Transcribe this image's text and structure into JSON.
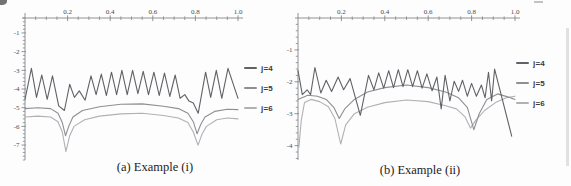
{
  "figure": {
    "background": "#fdfdfd",
    "axis_color": "#85868a",
    "tick_label_color": "#4a4a4e"
  },
  "chart_data": [
    {
      "type": "line",
      "title": "(a) Example (i)",
      "xlabel": "",
      "ylabel": "",
      "xlim": [
        0,
        1.0
      ],
      "ylim": [
        -7.8,
        -0.2
      ],
      "grid": false,
      "legend_position": "right",
      "x_ticks_major": [
        0.2,
        0.4,
        0.6,
        0.8,
        1.0
      ],
      "x_tick_labels": [
        "0.2",
        "0.4",
        "0.6",
        "0.8",
        "1.0"
      ],
      "x_minor_step": 0.05,
      "y_ticks_major": [
        -1,
        -2,
        -3,
        -4,
        -5,
        -6,
        -7
      ],
      "y_tick_labels": [
        "-1",
        "-2",
        "-3",
        "-4",
        "-5",
        "-6",
        "-7"
      ],
      "y_minor_step": 0.2,
      "series": [
        {
          "name": "j=4",
          "color": "#616267",
          "points": [
            [
              0,
              -4.55
            ],
            [
              0.03,
              -2.9
            ],
            [
              0.054,
              -4.45
            ],
            [
              0.079,
              -3.25
            ],
            [
              0.104,
              -4.55
            ],
            [
              0.129,
              -3.3
            ],
            [
              0.158,
              -4.9
            ],
            [
              0.185,
              -5.15
            ],
            [
              0.21,
              -3.75
            ],
            [
              0.232,
              -4.45
            ],
            [
              0.255,
              -4.1
            ],
            [
              0.282,
              -4.6
            ],
            [
              0.31,
              -3.3
            ],
            [
              0.334,
              -4.3
            ],
            [
              0.358,
              -3.2
            ],
            [
              0.382,
              -4.35
            ],
            [
              0.406,
              -3.1
            ],
            [
              0.43,
              -4.3
            ],
            [
              0.455,
              -3.0
            ],
            [
              0.48,
              -4.3
            ],
            [
              0.505,
              -3.0
            ],
            [
              0.53,
              -4.25
            ],
            [
              0.555,
              -3.05
            ],
            [
              0.58,
              -4.3
            ],
            [
              0.605,
              -3.1
            ],
            [
              0.63,
              -4.35
            ],
            [
              0.655,
              -3.15
            ],
            [
              0.68,
              -4.4
            ],
            [
              0.705,
              -3.25
            ],
            [
              0.728,
              -4.5
            ],
            [
              0.75,
              -4.3
            ],
            [
              0.77,
              -4.65
            ],
            [
              0.79,
              -4.75
            ],
            [
              0.813,
              -5.3
            ],
            [
              0.848,
              -3.1
            ],
            [
              0.872,
              -4.45
            ],
            [
              0.898,
              -3.0
            ],
            [
              0.924,
              -4.5
            ],
            [
              0.953,
              -2.9
            ],
            [
              1.0,
              -4.5
            ]
          ]
        },
        {
          "name": "j=5",
          "color": "#8e8f93",
          "points": [
            [
              0,
              -5.05
            ],
            [
              0.06,
              -5.0
            ],
            [
              0.12,
              -5.05
            ],
            [
              0.155,
              -5.3
            ],
            [
              0.175,
              -5.8
            ],
            [
              0.19,
              -6.5
            ],
            [
              0.205,
              -6.0
            ],
            [
              0.225,
              -5.5
            ],
            [
              0.27,
              -5.15
            ],
            [
              0.35,
              -4.95
            ],
            [
              0.45,
              -4.82
            ],
            [
              0.55,
              -4.8
            ],
            [
              0.65,
              -4.92
            ],
            [
              0.72,
              -5.05
            ],
            [
              0.765,
              -5.3
            ],
            [
              0.79,
              -5.75
            ],
            [
              0.808,
              -6.4
            ],
            [
              0.825,
              -5.9
            ],
            [
              0.845,
              -5.5
            ],
            [
              0.89,
              -5.2
            ],
            [
              0.95,
              -5.08
            ],
            [
              1.0,
              -5.1
            ]
          ]
        },
        {
          "name": "j=6",
          "color": "#b0b1b4",
          "points": [
            [
              0,
              -5.5
            ],
            [
              0.06,
              -5.45
            ],
            [
              0.12,
              -5.5
            ],
            [
              0.155,
              -5.75
            ],
            [
              0.175,
              -6.3
            ],
            [
              0.192,
              -7.35
            ],
            [
              0.21,
              -6.5
            ],
            [
              0.23,
              -6.0
            ],
            [
              0.28,
              -5.65
            ],
            [
              0.35,
              -5.45
            ],
            [
              0.45,
              -5.33
            ],
            [
              0.55,
              -5.3
            ],
            [
              0.65,
              -5.42
            ],
            [
              0.72,
              -5.55
            ],
            [
              0.765,
              -5.8
            ],
            [
              0.79,
              -6.3
            ],
            [
              0.812,
              -7.0
            ],
            [
              0.832,
              -6.4
            ],
            [
              0.852,
              -6.0
            ],
            [
              0.9,
              -5.65
            ],
            [
              0.95,
              -5.55
            ],
            [
              1.0,
              -5.6
            ]
          ]
        }
      ]
    },
    {
      "type": "line",
      "title": "(b) Example (ii)",
      "xlabel": "",
      "ylabel": "",
      "xlim": [
        0,
        1.0
      ],
      "ylim": [
        -4.45,
        0.0
      ],
      "grid": false,
      "legend_position": "right",
      "x_ticks_major": [
        0.2,
        0.4,
        0.6,
        0.8,
        1.0
      ],
      "x_tick_labels": [
        "0.2",
        "0.4",
        "0.6",
        "0.8",
        "1.0"
      ],
      "x_minor_step": 0.05,
      "y_ticks_major": [
        -1,
        -2,
        -3,
        -4
      ],
      "y_tick_labels": [
        "-1",
        "-2",
        "-3",
        "-4"
      ],
      "y_minor_step": 0.2,
      "series": [
        {
          "name": "j=4",
          "color": "#616267",
          "points": [
            [
              0,
              -1.65
            ],
            [
              0.02,
              -2.4
            ],
            [
              0.042,
              -2.25
            ],
            [
              0.058,
              -2.4
            ],
            [
              0.078,
              -1.55
            ],
            [
              0.105,
              -2.35
            ],
            [
              0.13,
              -1.95
            ],
            [
              0.155,
              -2.3
            ],
            [
              0.185,
              -1.85
            ],
            [
              0.21,
              -2.25
            ],
            [
              0.24,
              -1.9
            ],
            [
              0.287,
              -3.05
            ],
            [
              0.325,
              -1.8
            ],
            [
              0.35,
              -2.25
            ],
            [
              0.372,
              -1.72
            ],
            [
              0.395,
              -2.2
            ],
            [
              0.418,
              -1.65
            ],
            [
              0.44,
              -2.18
            ],
            [
              0.462,
              -1.62
            ],
            [
              0.484,
              -2.15
            ],
            [
              0.506,
              -1.62
            ],
            [
              0.528,
              -2.15
            ],
            [
              0.55,
              -1.65
            ],
            [
              0.572,
              -2.2
            ],
            [
              0.594,
              -1.75
            ],
            [
              0.618,
              -2.28
            ],
            [
              0.64,
              -1.85
            ],
            [
              0.66,
              -2.85
            ],
            [
              0.678,
              -1.8
            ],
            [
              0.7,
              -2.6
            ],
            [
              0.72,
              -1.98
            ],
            [
              0.74,
              -2.3
            ],
            [
              0.758,
              -1.95
            ],
            [
              0.78,
              -2.45
            ],
            [
              0.8,
              -2.05
            ],
            [
              0.822,
              -2.45
            ],
            [
              0.845,
              -2.1
            ],
            [
              0.862,
              -2.5
            ],
            [
              0.878,
              -1.7
            ],
            [
              0.892,
              -2.6
            ],
            [
              0.906,
              -1.6
            ],
            [
              0.985,
              -3.7
            ]
          ]
        },
        {
          "name": "j=5",
          "color": "#8e8f93",
          "points": [
            [
              0,
              -2.55
            ],
            [
              0.045,
              -2.42
            ],
            [
              0.09,
              -2.45
            ],
            [
              0.13,
              -2.55
            ],
            [
              0.165,
              -2.8
            ],
            [
              0.19,
              -3.15
            ],
            [
              0.215,
              -2.85
            ],
            [
              0.26,
              -2.55
            ],
            [
              0.32,
              -2.32
            ],
            [
              0.4,
              -2.18
            ],
            [
              0.5,
              -2.1
            ],
            [
              0.6,
              -2.18
            ],
            [
              0.68,
              -2.32
            ],
            [
              0.74,
              -2.5
            ],
            [
              0.78,
              -2.8
            ],
            [
              0.81,
              -3.5
            ],
            [
              0.835,
              -3.0
            ],
            [
              0.87,
              -2.55
            ],
            [
              0.92,
              -2.38
            ],
            [
              0.97,
              -2.48
            ],
            [
              1.0,
              -2.55
            ]
          ]
        },
        {
          "name": "j=6",
          "color": "#b0b1b4",
          "points": [
            [
              0.004,
              -4.05
            ],
            [
              0.015,
              -3.2
            ],
            [
              0.03,
              -2.65
            ],
            [
              0.06,
              -2.55
            ],
            [
              0.1,
              -2.62
            ],
            [
              0.14,
              -2.78
            ],
            [
              0.17,
              -3.15
            ],
            [
              0.197,
              -3.95
            ],
            [
              0.22,
              -3.35
            ],
            [
              0.26,
              -3.0
            ],
            [
              0.32,
              -2.8
            ],
            [
              0.4,
              -2.65
            ],
            [
              0.5,
              -2.57
            ],
            [
              0.6,
              -2.62
            ],
            [
              0.68,
              -2.75
            ],
            [
              0.73,
              -2.85
            ],
            [
              0.77,
              -3.1
            ],
            [
              0.795,
              -3.45
            ],
            [
              0.82,
              -3.2
            ],
            [
              0.86,
              -2.9
            ],
            [
              0.91,
              -2.65
            ],
            [
              0.96,
              -2.5
            ],
            [
              1.0,
              -2.45
            ]
          ]
        }
      ]
    }
  ],
  "legends": {
    "a": [
      "j=4",
      "j=5",
      "j=6"
    ],
    "b": [
      "j=4",
      "j=5",
      "j=6"
    ]
  }
}
